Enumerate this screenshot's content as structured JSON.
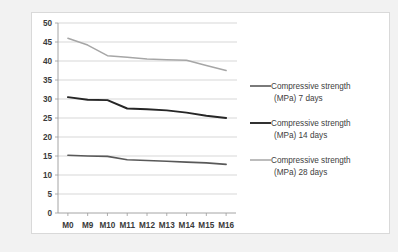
{
  "chart_data": {
    "type": "line",
    "title": "",
    "xlabel": "",
    "ylabel": "",
    "ylim": [
      0,
      50
    ],
    "ytick_step": 5,
    "yticks": [
      "0",
      "5",
      "10",
      "15",
      "20",
      "25",
      "30",
      "35",
      "40",
      "45",
      "50"
    ],
    "grid": true,
    "legend_position": "right",
    "categories": [
      "M0",
      "M9",
      "M10",
      "M11",
      "M12",
      "M13",
      "M14",
      "M15",
      "M16"
    ],
    "series": [
      {
        "name": "Compressive strength (MPa) 7 days",
        "color": "#595959",
        "values": [
          15.2,
          15.0,
          14.9,
          14.0,
          13.8,
          13.6,
          13.4,
          13.2,
          12.8
        ]
      },
      {
        "name": "Compressive strength (MPa) 14 days",
        "color": "#262626",
        "values": [
          30.5,
          29.8,
          29.7,
          27.5,
          27.3,
          27.0,
          26.4,
          25.6,
          25.0
        ]
      },
      {
        "name": "Compressive strength (MPa) 28 days",
        "color": "#a6a6a6",
        "values": [
          46.0,
          44.2,
          41.4,
          41.0,
          40.5,
          40.3,
          40.2,
          38.8,
          37.5
        ]
      }
    ]
  },
  "legend": {
    "items": [
      {
        "line1": "Compressive strength",
        "line2": "(MPa) 7 days",
        "color": "#595959"
      },
      {
        "line1": "Compressive strength",
        "line2": "(MPa) 14 days",
        "color": "#262626"
      },
      {
        "line1": "Compressive strength",
        "line2": "(MPa) 28 days",
        "color": "#a6a6a6"
      }
    ]
  },
  "colors": {
    "page_background": "#f2f2f2",
    "panel_background": "#ffffff",
    "panel_border": "#d9d9d9",
    "gridline": "#c6c6c6",
    "axis": "#9a9a9a",
    "tick_text": "#3a3a3a",
    "legend_text": "#404040"
  }
}
